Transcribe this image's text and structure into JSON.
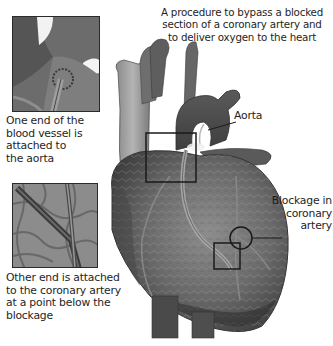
{
  "diagram": {
    "headline": "A procedure to bypass a blocked\nsection of a coronary artery and\nto deliver oxygen to the heart",
    "labels": {
      "aorta": "Aorta",
      "blockage": "Blockage in\ncoronary\nartery"
    },
    "insets": [
      {
        "id": "top",
        "caption": "One end of the\nblood vessel is\nattached to\nthe aorta",
        "depicts": "graft attached to aorta (close-up)"
      },
      {
        "id": "bottom",
        "caption": "Other end is attached\nto the coronary artery\nat a point below the\nblockage",
        "depicts": "graft attached to coronary artery below blockage (close-up)"
      }
    ],
    "callouts": [
      {
        "shape": "square",
        "target": "aorta graft attachment",
        "linked_inset": "top"
      },
      {
        "shape": "circle",
        "target": "blockage in coronary artery"
      },
      {
        "shape": "square",
        "target": "coronary graft attachment below blockage",
        "linked_inset": "bottom"
      }
    ],
    "colors": {
      "background": "#ffffff",
      "text": "#1e1e1e",
      "heart_dark": "#3c3c3c",
      "heart_mid": "#6a6a6a",
      "heart_light": "#9a9a9a",
      "callout_stroke": "#1a1a1a"
    }
  }
}
